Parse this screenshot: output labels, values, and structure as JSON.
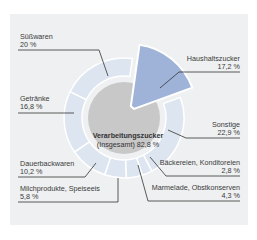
{
  "chart_data": {
    "type": "pie",
    "title": "",
    "center": {
      "label": "Verarbeitungszucker",
      "sublabel": "(Insgesamt) 82,8 %",
      "value": 82.8
    },
    "exploded": {
      "label": "Haushaltszucker",
      "value_text": "17,2 %",
      "value": 17.2,
      "color": "#9fb3d8"
    },
    "categories": [
      "Haushaltszucker",
      "Sonstige",
      "Bäckereien, Konditoreien",
      "Marmelade, Obstkonserven",
      "Milchprodukte, Speiseeis",
      "Dauerbackwaren",
      "Getränke",
      "Süßwaren"
    ],
    "values": [
      17.2,
      22.9,
      2.8,
      4.3,
      5.8,
      10.2,
      16.8,
      20.0
    ],
    "value_labels": [
      "17,2 %",
      "22,9 %",
      "2,8 %",
      "4,3 %",
      "5,8 %",
      "10,2 %",
      "16,8 %",
      "20 %"
    ],
    "colors": {
      "ring": "#dde5f0",
      "center": "#c8c8c8",
      "exploded": "#9fb3d8",
      "background": "#eef0f1",
      "leader": "#333333"
    }
  },
  "labels": {
    "suesswaren": {
      "name": "Süßwaren",
      "value": "20 %"
    },
    "getraenke": {
      "name": "Getränke",
      "value": "16,8 %"
    },
    "dauerbackwaren": {
      "name": "Dauerbackwaren",
      "value": "10,2 %"
    },
    "milchprodukte": {
      "name": "Milchprodukte, Speiseeis",
      "value": "5,8 %"
    },
    "haushaltszucker": {
      "name": "Haushaltszucker",
      "value": "17,2 %"
    },
    "sonstige": {
      "name": "Sonstige",
      "value": "22,9 %"
    },
    "baeckereien": {
      "name": "Bäckereien, Konditoreien",
      "value": "2,8 %"
    },
    "marmelade": {
      "name": "Marmelade, Obstkonserven",
      "value": "4,3 %"
    },
    "center_title": "Verarbeitungszucker",
    "center_sub": "(Insgesamt) 82,8 %"
  }
}
